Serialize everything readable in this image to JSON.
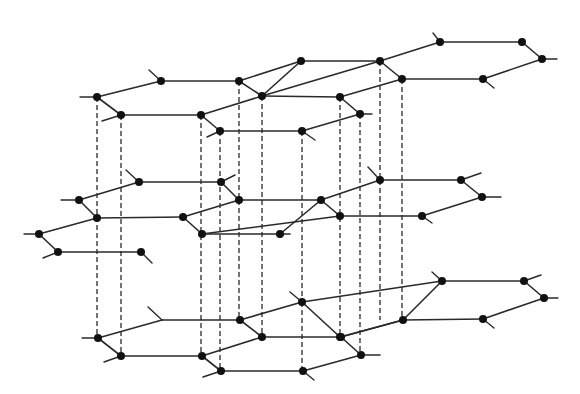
{
  "diagram": {
    "colors": {
      "bond": "#2a2a2a",
      "atom": "#111111",
      "background": "#ffffff"
    },
    "atom_radius": 4,
    "layers": [
      {
        "name": "top-layer",
        "atoms": [
          [
            97,
            97
          ],
          [
            161,
            81
          ],
          [
            239,
            81
          ],
          [
            262,
            96
          ],
          [
            121,
            115
          ],
          [
            201,
            115
          ],
          [
            220,
            131
          ],
          [
            301,
            61
          ],
          [
            380,
            61
          ],
          [
            440,
            42
          ],
          [
            522,
            42
          ],
          [
            542,
            59
          ],
          [
            483,
            79
          ],
          [
            402,
            79
          ],
          [
            340,
            97
          ],
          [
            360,
            114
          ],
          [
            302,
            131
          ]
        ],
        "bonds": [
          [
            97,
            97,
            161,
            81
          ],
          [
            161,
            81,
            239,
            81
          ],
          [
            239,
            81,
            262,
            96
          ],
          [
            97,
            97,
            121,
            115
          ],
          [
            121,
            115,
            201,
            115
          ],
          [
            201,
            115,
            262,
            96
          ],
          [
            201,
            115,
            220,
            131
          ],
          [
            220,
            131,
            302,
            131
          ],
          [
            262,
            96,
            301,
            61
          ],
          [
            262,
            96,
            380,
            61
          ],
          [
            239,
            81,
            301,
            61
          ],
          [
            301,
            61,
            380,
            61
          ],
          [
            380,
            61,
            440,
            42
          ],
          [
            440,
            42,
            522,
            42
          ],
          [
            522,
            42,
            542,
            59
          ],
          [
            542,
            59,
            483,
            79
          ],
          [
            483,
            79,
            402,
            79
          ],
          [
            380,
            61,
            402,
            79
          ],
          [
            402,
            79,
            340,
            97
          ],
          [
            340,
            97,
            360,
            114
          ],
          [
            360,
            114,
            302,
            131
          ],
          [
            262,
            96,
            340,
            97
          ]
        ],
        "stubs": [
          [
            97,
            97,
            80,
            97
          ],
          [
            161,
            81,
            149,
            70
          ],
          [
            121,
            115,
            102,
            121
          ],
          [
            220,
            131,
            207,
            137
          ],
          [
            440,
            42,
            433,
            33
          ],
          [
            542,
            59,
            557,
            59
          ],
          [
            483,
            79,
            494,
            88
          ],
          [
            360,
            114,
            372,
            114
          ],
          [
            302,
            131,
            315,
            140
          ]
        ]
      },
      {
        "name": "middle-layer",
        "atoms": [
          [
            139,
            182
          ],
          [
            221,
            182
          ],
          [
            79,
            200
          ],
          [
            97,
            218
          ],
          [
            239,
            200
          ],
          [
            183,
            217
          ],
          [
            39,
            234
          ],
          [
            202,
            234
          ],
          [
            280,
            234
          ],
          [
            58,
            252
          ],
          [
            141,
            252
          ],
          [
            380,
            180
          ],
          [
            461,
            180
          ],
          [
            321,
            200
          ],
          [
            482,
            197
          ],
          [
            340,
            216
          ],
          [
            422,
            216
          ]
        ],
        "bonds": [
          [
            79,
            200,
            139,
            182
          ],
          [
            139,
            182,
            221,
            182
          ],
          [
            221,
            182,
            239,
            200
          ],
          [
            79,
            200,
            97,
            218
          ],
          [
            97,
            218,
            183,
            217
          ],
          [
            183,
            217,
            239,
            200
          ],
          [
            39,
            234,
            97,
            218
          ],
          [
            183,
            217,
            202,
            234
          ],
          [
            39,
            234,
            58,
            252
          ],
          [
            58,
            252,
            141,
            252
          ],
          [
            202,
            234,
            280,
            234
          ],
          [
            239,
            200,
            321,
            200
          ],
          [
            280,
            234,
            321,
            200
          ],
          [
            321,
            200,
            380,
            180
          ],
          [
            380,
            180,
            461,
            180
          ],
          [
            461,
            180,
            482,
            197
          ],
          [
            321,
            200,
            340,
            216
          ],
          [
            340,
            216,
            422,
            216
          ],
          [
            422,
            216,
            482,
            197
          ],
          [
            202,
            234,
            340,
            216
          ],
          [
            280,
            234,
            290,
            234
          ]
        ],
        "stubs": [
          [
            79,
            200,
            61,
            200
          ],
          [
            139,
            182,
            126,
            170
          ],
          [
            221,
            182,
            235,
            175
          ],
          [
            39,
            234,
            24,
            234
          ],
          [
            58,
            252,
            43,
            258
          ],
          [
            141,
            252,
            152,
            263
          ],
          [
            380,
            180,
            368,
            167
          ],
          [
            461,
            180,
            481,
            173
          ],
          [
            482,
            197,
            501,
            197
          ],
          [
            422,
            216,
            432,
            223
          ]
        ]
      },
      {
        "name": "bottom-layer",
        "atoms": [
          [
            240,
            320
          ],
          [
            302,
            302
          ],
          [
            98,
            338
          ],
          [
            262,
            337
          ],
          [
            340,
            337
          ],
          [
            121,
            356
          ],
          [
            202,
            356
          ],
          [
            221,
            371
          ],
          [
            303,
            371
          ],
          [
            442,
            281
          ],
          [
            524,
            281
          ],
          [
            544,
            298
          ],
          [
            403,
            320
          ],
          [
            483,
            319
          ],
          [
            341,
            337
          ],
          [
            361,
            355
          ]
        ],
        "bonds": [
          [
            98,
            338,
            162,
            320
          ],
          [
            162,
            320,
            240,
            320
          ],
          [
            240,
            320,
            262,
            337
          ],
          [
            98,
            338,
            121,
            356
          ],
          [
            121,
            356,
            202,
            356
          ],
          [
            202,
            356,
            262,
            337
          ],
          [
            202,
            356,
            221,
            371
          ],
          [
            221,
            371,
            303,
            371
          ],
          [
            262,
            337,
            340,
            337
          ],
          [
            240,
            320,
            302,
            302
          ],
          [
            302,
            302,
            442,
            281
          ],
          [
            340,
            337,
            403,
            320
          ],
          [
            302,
            302,
            340,
            337
          ],
          [
            303,
            371,
            361,
            355
          ],
          [
            341,
            337,
            361,
            355
          ],
          [
            341,
            337,
            403,
            320
          ],
          [
            403,
            320,
            483,
            319
          ],
          [
            442,
            281,
            524,
            281
          ],
          [
            524,
            281,
            544,
            298
          ],
          [
            544,
            298,
            483,
            319
          ],
          [
            403,
            320,
            442,
            281
          ],
          [
            361,
            355,
            380,
            355
          ]
        ],
        "stubs": [
          [
            162,
            320,
            148,
            307
          ],
          [
            98,
            338,
            82,
            338
          ],
          [
            121,
            356,
            104,
            362
          ],
          [
            221,
            371,
            203,
            377
          ],
          [
            303,
            371,
            314,
            380
          ],
          [
            302,
            302,
            290,
            292
          ],
          [
            442,
            281,
            432,
            272
          ],
          [
            524,
            281,
            541,
            275
          ],
          [
            544,
            298,
            558,
            298
          ],
          [
            483,
            319,
            494,
            328
          ]
        ]
      }
    ],
    "interlayer_dashes": [
      [
        97,
        97,
        97,
        338
      ],
      [
        121,
        115,
        121,
        356
      ],
      [
        201,
        115,
        201,
        356
      ],
      [
        220,
        131,
        220,
        371
      ],
      [
        239,
        81,
        239,
        200
      ],
      [
        239,
        200,
        239,
        320
      ],
      [
        262,
        96,
        262,
        337
      ],
      [
        302,
        131,
        302,
        302
      ],
      [
        302,
        302,
        302,
        371
      ],
      [
        340,
        97,
        340,
        337
      ],
      [
        360,
        114,
        360,
        355
      ],
      [
        380,
        61,
        380,
        180
      ],
      [
        380,
        180,
        380,
        320
      ],
      [
        402,
        79,
        402,
        320
      ]
    ]
  }
}
